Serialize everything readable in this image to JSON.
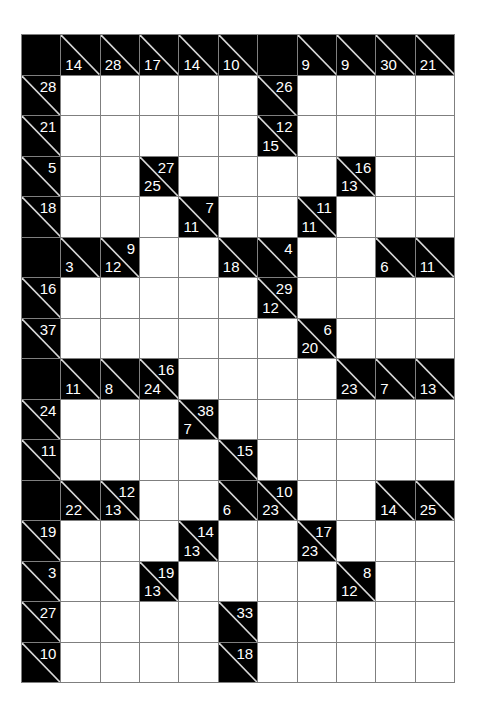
{
  "puzzle": {
    "type": "kakuro",
    "columns": 11,
    "rows": 16,
    "colors": {
      "block": "#000000",
      "empty": "#ffffff",
      "grid_line": "#7f7f7f",
      "clue_text": "#ffffff"
    },
    "legend": {
      "X": "solid block",
      "W": "empty entry cell",
      "a": "across sum",
      "d": "down sum"
    },
    "grid": [
      [
        {
          "t": "X"
        },
        {
          "t": "C",
          "d": "14"
        },
        {
          "t": "C",
          "d": "28"
        },
        {
          "t": "C",
          "d": "17"
        },
        {
          "t": "C",
          "d": "14"
        },
        {
          "t": "C",
          "d": "10"
        },
        {
          "t": "X"
        },
        {
          "t": "C",
          "d": "9"
        },
        {
          "t": "C",
          "d": "9"
        },
        {
          "t": "C",
          "d": "30"
        },
        {
          "t": "C",
          "d": "21"
        }
      ],
      [
        {
          "t": "C",
          "a": "28"
        },
        {
          "t": "W"
        },
        {
          "t": "W"
        },
        {
          "t": "W"
        },
        {
          "t": "W"
        },
        {
          "t": "W"
        },
        {
          "t": "C",
          "a": "26"
        },
        {
          "t": "W"
        },
        {
          "t": "W"
        },
        {
          "t": "W"
        },
        {
          "t": "W"
        }
      ],
      [
        {
          "t": "C",
          "a": "21"
        },
        {
          "t": "W"
        },
        {
          "t": "W"
        },
        {
          "t": "W"
        },
        {
          "t": "W"
        },
        {
          "t": "W"
        },
        {
          "t": "C",
          "a": "12",
          "d": "15"
        },
        {
          "t": "W"
        },
        {
          "t": "W"
        },
        {
          "t": "W"
        },
        {
          "t": "W"
        }
      ],
      [
        {
          "t": "C",
          "a": "5"
        },
        {
          "t": "W"
        },
        {
          "t": "W"
        },
        {
          "t": "C",
          "a": "27",
          "d": "25"
        },
        {
          "t": "W"
        },
        {
          "t": "W"
        },
        {
          "t": "W"
        },
        {
          "t": "W"
        },
        {
          "t": "C",
          "a": "16",
          "d": "13"
        },
        {
          "t": "W"
        },
        {
          "t": "W"
        }
      ],
      [
        {
          "t": "C",
          "a": "18"
        },
        {
          "t": "W"
        },
        {
          "t": "W"
        },
        {
          "t": "W"
        },
        {
          "t": "C",
          "a": "7",
          "d": "11"
        },
        {
          "t": "W"
        },
        {
          "t": "W"
        },
        {
          "t": "C",
          "a": "11",
          "d": "11"
        },
        {
          "t": "W"
        },
        {
          "t": "W"
        },
        {
          "t": "W"
        }
      ],
      [
        {
          "t": "X"
        },
        {
          "t": "C",
          "d": "3"
        },
        {
          "t": "C",
          "a": "9",
          "d": "12"
        },
        {
          "t": "W"
        },
        {
          "t": "W"
        },
        {
          "t": "C",
          "d": "18"
        },
        {
          "t": "C",
          "a": "4"
        },
        {
          "t": "W"
        },
        {
          "t": "W"
        },
        {
          "t": "C",
          "d": "6"
        },
        {
          "t": "C",
          "d": "11"
        }
      ],
      [
        {
          "t": "C",
          "a": "16"
        },
        {
          "t": "W"
        },
        {
          "t": "W"
        },
        {
          "t": "W"
        },
        {
          "t": "W"
        },
        {
          "t": "W"
        },
        {
          "t": "C",
          "a": "29",
          "d": "12"
        },
        {
          "t": "W"
        },
        {
          "t": "W"
        },
        {
          "t": "W"
        },
        {
          "t": "W"
        }
      ],
      [
        {
          "t": "C",
          "a": "37"
        },
        {
          "t": "W"
        },
        {
          "t": "W"
        },
        {
          "t": "W"
        },
        {
          "t": "W"
        },
        {
          "t": "W"
        },
        {
          "t": "W"
        },
        {
          "t": "C",
          "a": "6",
          "d": "20"
        },
        {
          "t": "W"
        },
        {
          "t": "W"
        },
        {
          "t": "W"
        }
      ],
      [
        {
          "t": "X"
        },
        {
          "t": "C",
          "d": "11"
        },
        {
          "t": "C",
          "d": "8"
        },
        {
          "t": "C",
          "a": "16",
          "d": "24"
        },
        {
          "t": "W"
        },
        {
          "t": "W"
        },
        {
          "t": "W"
        },
        {
          "t": "W"
        },
        {
          "t": "C",
          "d": "23"
        },
        {
          "t": "C",
          "d": "7"
        },
        {
          "t": "C",
          "d": "13"
        }
      ],
      [
        {
          "t": "C",
          "a": "24"
        },
        {
          "t": "W"
        },
        {
          "t": "W"
        },
        {
          "t": "W"
        },
        {
          "t": "C",
          "a": "38",
          "d": "7"
        },
        {
          "t": "W"
        },
        {
          "t": "W"
        },
        {
          "t": "W"
        },
        {
          "t": "W"
        },
        {
          "t": "W"
        },
        {
          "t": "W"
        }
      ],
      [
        {
          "t": "C",
          "a": "11"
        },
        {
          "t": "W"
        },
        {
          "t": "W"
        },
        {
          "t": "W"
        },
        {
          "t": "W"
        },
        {
          "t": "C",
          "a": "15"
        },
        {
          "t": "W"
        },
        {
          "t": "W"
        },
        {
          "t": "W"
        },
        {
          "t": "W"
        },
        {
          "t": "W"
        }
      ],
      [
        {
          "t": "X"
        },
        {
          "t": "C",
          "d": "22"
        },
        {
          "t": "C",
          "a": "12",
          "d": "13"
        },
        {
          "t": "W"
        },
        {
          "t": "W"
        },
        {
          "t": "C",
          "d": "6"
        },
        {
          "t": "C",
          "a": "10",
          "d": "23"
        },
        {
          "t": "W"
        },
        {
          "t": "W"
        },
        {
          "t": "C",
          "d": "14"
        },
        {
          "t": "C",
          "d": "25"
        }
      ],
      [
        {
          "t": "C",
          "a": "19"
        },
        {
          "t": "W"
        },
        {
          "t": "W"
        },
        {
          "t": "W"
        },
        {
          "t": "C",
          "a": "14",
          "d": "13"
        },
        {
          "t": "W"
        },
        {
          "t": "W"
        },
        {
          "t": "C",
          "a": "17",
          "d": "23"
        },
        {
          "t": "W"
        },
        {
          "t": "W"
        },
        {
          "t": "W"
        }
      ],
      [
        {
          "t": "C",
          "a": "3"
        },
        {
          "t": "W"
        },
        {
          "t": "W"
        },
        {
          "t": "C",
          "a": "19",
          "d": "13"
        },
        {
          "t": "W"
        },
        {
          "t": "W"
        },
        {
          "t": "W"
        },
        {
          "t": "W"
        },
        {
          "t": "C",
          "a": "8",
          "d": "12"
        },
        {
          "t": "W"
        },
        {
          "t": "W"
        }
      ],
      [
        {
          "t": "C",
          "a": "27"
        },
        {
          "t": "W"
        },
        {
          "t": "W"
        },
        {
          "t": "W"
        },
        {
          "t": "W"
        },
        {
          "t": "C",
          "a": "33"
        },
        {
          "t": "W"
        },
        {
          "t": "W"
        },
        {
          "t": "W"
        },
        {
          "t": "W"
        },
        {
          "t": "W"
        }
      ],
      [
        {
          "t": "C",
          "a": "10"
        },
        {
          "t": "W"
        },
        {
          "t": "W"
        },
        {
          "t": "W"
        },
        {
          "t": "W"
        },
        {
          "t": "C",
          "a": "18"
        },
        {
          "t": "W"
        },
        {
          "t": "W"
        },
        {
          "t": "W"
        },
        {
          "t": "W"
        },
        {
          "t": "W"
        }
      ]
    ]
  }
}
